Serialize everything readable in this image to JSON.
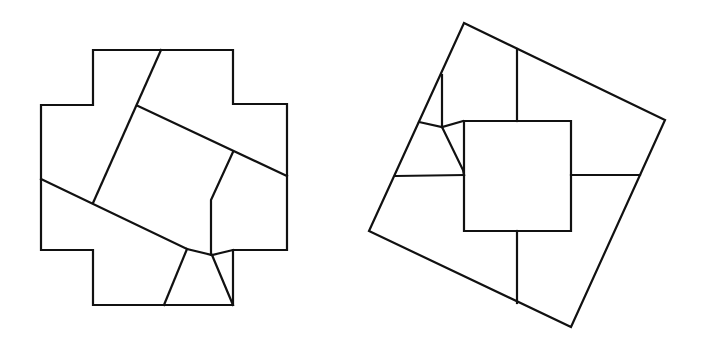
{
  "figure": {
    "width": 702,
    "height": 350,
    "background": "#ffffff",
    "stroke_color": "#111111",
    "left_figure": {
      "name": "cross-dissection",
      "outline": "93,50 233,50 233,104 287,104 287,250 233,250 233,305 93,305 93,250 41,250 41,105 93,105",
      "cuts": [
        "161,50 93,203",
        "138,106 287,176",
        "41,179 187,249 212,255 233,250",
        "233,152 211,200 211,255",
        "187,249 164,305",
        "212,255 233,305"
      ]
    },
    "right_figure": {
      "name": "square-dissection",
      "outline": "464,23 665,120 571,327 369,231",
      "inner_square": "464,121 571,121 571,231 464,231",
      "cuts": [
        "517,49 517,121",
        "517,231 517,303",
        "571,175 640,175",
        "396,176 464,175",
        "442,75 442,127",
        "419,122 442,127 463,121",
        "442,127 463,170 464,175"
      ]
    }
  }
}
